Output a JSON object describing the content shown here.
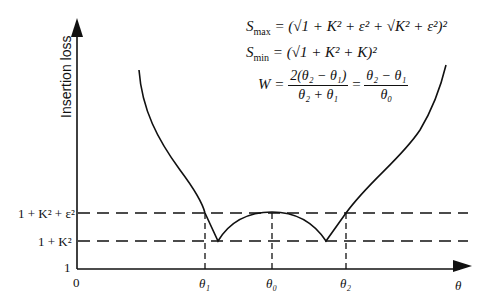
{
  "diagram": {
    "y_axis": {
      "label": "Insertion loss",
      "ticks": [
        "1 + K² + ε²",
        "1 + K²",
        "1"
      ]
    },
    "x_axis": {
      "label": "θ",
      "ticks": [
        "0",
        "θ₁",
        "θ₀",
        "θ₂"
      ]
    },
    "levels": {
      "upper": "1 + K² + ε²",
      "lower": "1 + K²",
      "base": "1"
    },
    "formulas": {
      "smax_lhs": "S",
      "smax_sub": "max",
      "smax_rhs": " = (√1 + K² + ε² + √K² + ε²)²",
      "smin_lhs": "S",
      "smin_sub": "min",
      "smin_rhs": " = (√1 + K² + K)²",
      "w_lhs": "W = ",
      "w_frac1_num": "2(θ₂ − θ₁)",
      "w_frac1_den": "θ₂ + θ₁",
      "w_eq": " = ",
      "w_frac2_num": "θ₂ − θ₁",
      "w_frac2_den": "θ₀"
    }
  }
}
